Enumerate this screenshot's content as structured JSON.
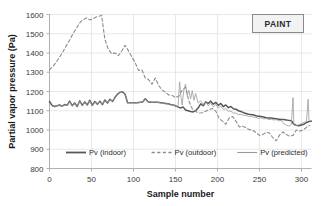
{
  "badge": {
    "label": "PAINT"
  },
  "chart_data": {
    "type": "line",
    "title": "",
    "xlabel": "Sample number",
    "ylabel": "Partial vapor pressure (Pa)",
    "xlim": [
      0,
      312
    ],
    "ylim": [
      800,
      1600
    ],
    "xticks": [
      0,
      50,
      100,
      150,
      200,
      250,
      300
    ],
    "yticks": [
      800,
      900,
      1000,
      1100,
      1200,
      1300,
      1400,
      1500,
      1600
    ],
    "grid": true,
    "legend_position": "inside-bottom-center",
    "colors": {
      "indoor": "#585858",
      "outdoor": "#8c8c8c",
      "predicted": "#9a9a9a",
      "grid": "#e2e2e2",
      "axis": "#b0b0b0"
    },
    "series": [
      {
        "name": "Pv  (indoor)",
        "style": "solid",
        "width": 1.5,
        "x": [
          0,
          3,
          6,
          9,
          12,
          15,
          18,
          21,
          24,
          27,
          30,
          33,
          36,
          39,
          42,
          45,
          48,
          51,
          54,
          57,
          60,
          63,
          66,
          69,
          72,
          75,
          78,
          81,
          84,
          87,
          90,
          93,
          96,
          99,
          102,
          105,
          108,
          111,
          114,
          117,
          120,
          123,
          126,
          129,
          132,
          135,
          138,
          141,
          144,
          147,
          150,
          153,
          156,
          159,
          162,
          165,
          168,
          171,
          174,
          177,
          180,
          183,
          186,
          189,
          192,
          195,
          198,
          201,
          204,
          207,
          210,
          213,
          216,
          219,
          222,
          225,
          228,
          231,
          234,
          237,
          240,
          243,
          246,
          249,
          252,
          255,
          258,
          261,
          264,
          267,
          270,
          273,
          276,
          279,
          282,
          285,
          288,
          291,
          294,
          297,
          300,
          303,
          306,
          309,
          312
        ],
        "y": [
          1148,
          1128,
          1122,
          1126,
          1130,
          1124,
          1132,
          1128,
          1150,
          1126,
          1140,
          1122,
          1152,
          1128,
          1146,
          1130,
          1154,
          1128,
          1148,
          1134,
          1150,
          1132,
          1156,
          1140,
          1160,
          1148,
          1170,
          1186,
          1196,
          1198,
          1186,
          1142,
          1142,
          1142,
          1142,
          1142,
          1144,
          1146,
          1162,
          1148,
          1144,
          1144,
          1144,
          1144,
          1142,
          1140,
          1138,
          1136,
          1132,
          1130,
          1126,
          1120,
          1114,
          1120,
          1104,
          1100,
          1096,
          1094,
          1100,
          1114,
          1136,
          1126,
          1146,
          1138,
          1150,
          1134,
          1144,
          1128,
          1138,
          1122,
          1130,
          1116,
          1122,
          1110,
          1108,
          1100,
          1096,
          1090,
          1086,
          1082,
          1080,
          1078,
          1074,
          1072,
          1070,
          1068,
          1064,
          1062,
          1062,
          1060,
          1058,
          1056,
          1054,
          1054,
          1052,
          1050,
          1048,
          1030,
          1024,
          1022,
          1026,
          1030,
          1038,
          1044,
          1046
        ]
      },
      {
        "name": "Pv (outdoor)",
        "style": "dashed",
        "width": 1.1,
        "x": [
          0,
          4,
          8,
          12,
          16,
          20,
          24,
          28,
          32,
          36,
          40,
          44,
          48,
          52,
          56,
          60,
          62,
          66,
          70,
          74,
          78,
          82,
          86,
          90,
          94,
          98,
          102,
          106,
          110,
          114,
          118,
          122,
          126,
          130,
          134,
          138,
          142,
          146,
          150,
          154,
          158,
          162,
          166,
          170,
          174,
          178,
          182,
          186,
          190,
          194,
          198,
          202,
          206,
          210,
          214,
          218,
          222,
          226,
          230,
          234,
          238,
          242,
          246,
          250,
          254,
          258,
          262,
          266,
          270,
          274,
          278,
          282,
          286,
          290,
          294,
          298,
          302,
          306,
          310
        ],
        "y": [
          1312,
          1330,
          1352,
          1378,
          1406,
          1438,
          1468,
          1500,
          1528,
          1556,
          1574,
          1582,
          1572,
          1578,
          1588,
          1592,
          1596,
          1470,
          1420,
          1396,
          1400,
          1386,
          1410,
          1440,
          1412,
          1380,
          1350,
          1310,
          1312,
          1270,
          1262,
          1238,
          1270,
          1232,
          1208,
          1196,
          1182,
          1180,
          1168,
          1176,
          1206,
          1222,
          1150,
          1110,
          1096,
          1088,
          1090,
          1098,
          1106,
          1112,
          1098,
          1060,
          1046,
          1030,
          1062,
          1070,
          1046,
          1016,
          1020,
          1012,
          1002,
          998,
          986,
          972,
          976,
          988,
          984,
          960,
          944,
          974,
          990,
          976,
          968,
          972,
          1000,
          994,
          1000,
          1014,
          1024
        ]
      },
      {
        "name": "Pv (predicted)",
        "style": "solid",
        "width": 0.8,
        "x": [
          0,
          3,
          6,
          9,
          12,
          15,
          18,
          21,
          24,
          27,
          30,
          33,
          36,
          39,
          42,
          45,
          48,
          51,
          54,
          57,
          60,
          63,
          66,
          69,
          72,
          75,
          78,
          81,
          84,
          87,
          90,
          93,
          96,
          99,
          102,
          105,
          108,
          111,
          114,
          117,
          120,
          123,
          126,
          129,
          132,
          135,
          138,
          141,
          144,
          147,
          150,
          153,
          155,
          156,
          158,
          160,
          162,
          164,
          166,
          168,
          170,
          172,
          174,
          177,
          180,
          183,
          186,
          189,
          192,
          195,
          198,
          201,
          204,
          207,
          210,
          213,
          216,
          219,
          222,
          225,
          228,
          231,
          234,
          237,
          240,
          243,
          246,
          249,
          252,
          255,
          258,
          261,
          264,
          267,
          270,
          273,
          276,
          279,
          282,
          285,
          288,
          290,
          291,
          292,
          294,
          297,
          300,
          303,
          306,
          308,
          309,
          310,
          312
        ],
        "y": [
          1140,
          1124,
          1120,
          1128,
          1126,
          1126,
          1130,
          1126,
          1148,
          1124,
          1138,
          1124,
          1150,
          1126,
          1144,
          1132,
          1150,
          1126,
          1146,
          1136,
          1148,
          1134,
          1154,
          1142,
          1158,
          1150,
          1168,
          1184,
          1194,
          1196,
          1184,
          1144,
          1140,
          1144,
          1140,
          1144,
          1142,
          1148,
          1160,
          1146,
          1146,
          1142,
          1146,
          1142,
          1144,
          1138,
          1140,
          1134,
          1134,
          1128,
          1128,
          1118,
          1250,
          1190,
          1130,
          1208,
          1238,
          1180,
          1206,
          1162,
          1204,
          1154,
          1190,
          1140,
          1152,
          1132,
          1146,
          1126,
          1140,
          1120,
          1132,
          1114,
          1124,
          1108,
          1110,
          1098,
          1098,
          1088,
          1088,
          1080,
          1082,
          1076,
          1076,
          1070,
          1072,
          1066,
          1066,
          1060,
          1064,
          1058,
          1060,
          1054,
          1056,
          1052,
          1054,
          1048,
          1050,
          1032,
          1026,
          1020,
          1028,
          1168,
          1030,
          1024,
          1022,
          1028,
          1034,
          1040,
          1044,
          1160,
          1050,
          1046,
          1048
        ]
      }
    ]
  }
}
